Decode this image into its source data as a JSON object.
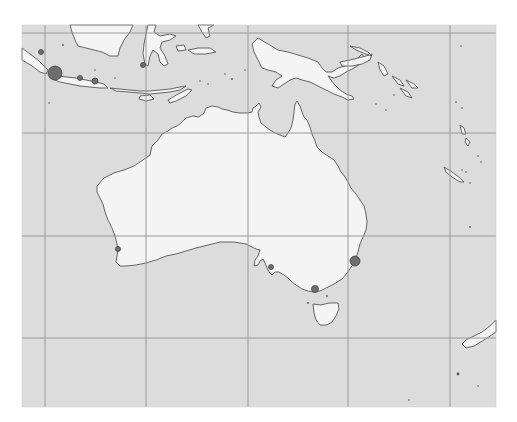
{
  "map": {
    "frame": {
      "x": 22,
      "y": 25,
      "width": 474,
      "height": 382
    },
    "colors": {
      "ocean": "#dcdcdc",
      "land": "#f4f4f4",
      "coast": "#555555",
      "grid": "#9a9a9a",
      "marker_fill": "#6e6e6e",
      "marker_stroke": "#444444",
      "background": "#ffffff"
    },
    "grid": {
      "vertical_x": [
        45,
        146,
        248,
        348,
        450
      ],
      "horizontal_y": [
        33,
        133,
        236,
        338
      ]
    },
    "markers": [
      {
        "name": "marker-jakarta",
        "x": 55,
        "y": 73,
        "r": 7
      },
      {
        "name": "marker-sumatra-south",
        "x": 41,
        "y": 52,
        "r": 2.5
      },
      {
        "name": "marker-bandung",
        "x": 80,
        "y": 78,
        "r": 2.5
      },
      {
        "name": "marker-semarang",
        "x": 95,
        "y": 81,
        "r": 3
      },
      {
        "name": "marker-sulawesi",
        "x": 143,
        "y": 65,
        "r": 2.5
      },
      {
        "name": "marker-perth",
        "x": 118,
        "y": 249,
        "r": 2.5
      },
      {
        "name": "marker-adelaide",
        "x": 271,
        "y": 267,
        "r": 2.5
      },
      {
        "name": "marker-melbourne",
        "x": 315,
        "y": 289,
        "r": 3.5
      },
      {
        "name": "marker-sydney",
        "x": 355,
        "y": 261,
        "r": 5
      }
    ]
  }
}
